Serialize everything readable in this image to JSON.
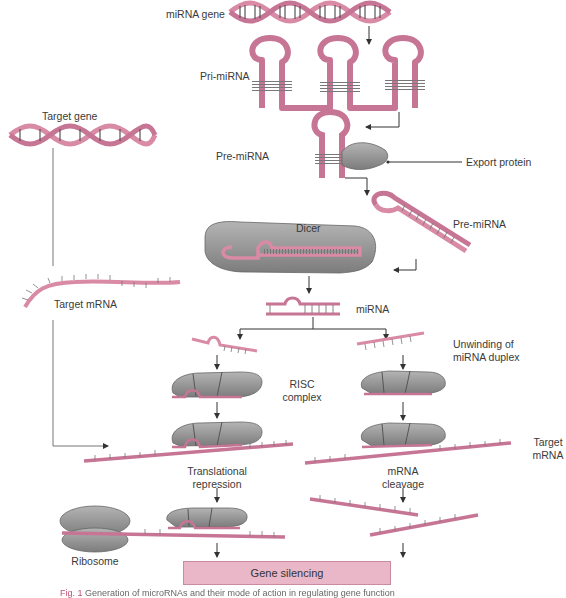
{
  "colors": {
    "rna_pink": "#d98aa5",
    "rna_pink_dark": "#b5607e",
    "protein_gray": "#9a9a9a",
    "protein_gray_dark": "#6e6e6e",
    "arrow": "#333333",
    "box_fill": "#e9b7c8",
    "box_border": "#c98aa2"
  },
  "labels": {
    "mirna_gene": "miRNA gene",
    "pri_mirna": "Pri-miRNA",
    "pre_mirna_nuclear": "Pre-miRNA",
    "export_protein": "Export protein",
    "pre_mirna_cytoplasm": "Pre-miRNA",
    "dicer": "Dicer",
    "mirna": "miRNA",
    "unwinding_line1": "Unwinding of",
    "unwinding_line2": "miRNA duplex",
    "risc_line1": "RISC",
    "risc_line2": "complex",
    "target_gene": "Target gene",
    "target_mrna_left": "Target mRNA",
    "target_mrna_right_line1": "Target",
    "target_mrna_right_line2": "mRNA",
    "translational_line1": "Translational",
    "translational_line2": "repression",
    "cleavage_line1": "mRNA",
    "cleavage_line2": "cleavage",
    "ribosome": "Ribosome",
    "gene_silencing": "Gene silencing"
  },
  "caption": {
    "prefix": "Fig. 1",
    "text": " Generation of microRNAs and their mode of action in regulating gene function"
  },
  "pathways": [
    {
      "name": "translational-repression",
      "branch": "left"
    },
    {
      "name": "mrna-cleavage",
      "branch": "right"
    }
  ]
}
